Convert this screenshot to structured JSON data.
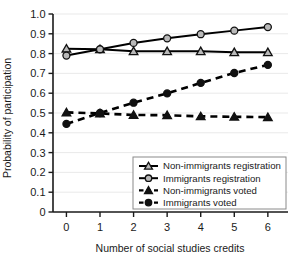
{
  "chart_data": {
    "type": "line",
    "title": "",
    "xlabel": "Number of social studies credits",
    "ylabel": "Probability of participation",
    "xlim": [
      -0.4,
      6.6
    ],
    "ylim": [
      0,
      1.0
    ],
    "xticks": [
      "0",
      "1",
      "2",
      "3",
      "4",
      "5",
      "6"
    ],
    "xtick_values": [
      0,
      1,
      2,
      3,
      4,
      5,
      6
    ],
    "yticks": [
      "0",
      "0.1",
      "0.2",
      "0.3",
      "0.4",
      "0.5",
      "0.6",
      "0.7",
      "0.8",
      "0.9",
      "1.0"
    ],
    "ytick_values": [
      0,
      0.1,
      0.2,
      0.3,
      0.4,
      0.5,
      0.6,
      0.7,
      0.8,
      0.9,
      1.0
    ],
    "grid": true,
    "legend_position": "lower-right",
    "x": [
      0,
      1,
      2,
      3,
      4,
      5,
      6
    ],
    "series": [
      {
        "name": "Non-immigrants registration",
        "marker": "open-triangle",
        "line": "solid",
        "color": "#000000",
        "values": [
          0.825,
          0.822,
          0.812,
          0.812,
          0.812,
          0.807,
          0.807
        ]
      },
      {
        "name": "Immigrants registration",
        "marker": "open-circle",
        "line": "solid",
        "color": "#000000",
        "values": [
          0.79,
          0.822,
          0.854,
          0.877,
          0.898,
          0.916,
          0.934
        ]
      },
      {
        "name": "Non-immigrants voted",
        "marker": "filled-triangle",
        "line": "dashed",
        "color": "#000000",
        "values": [
          0.503,
          0.498,
          0.49,
          0.489,
          0.483,
          0.481,
          0.479
        ]
      },
      {
        "name": "Immigrants voted",
        "marker": "filled-circle",
        "line": "dashed",
        "color": "#000000",
        "values": [
          0.445,
          0.5,
          0.552,
          0.599,
          0.652,
          0.702,
          0.743
        ]
      }
    ]
  },
  "legend": {
    "entries": [
      {
        "label": "Non-immigrants registration"
      },
      {
        "label": "Immigrants registration"
      },
      {
        "label": "Non-immigrants voted"
      },
      {
        "label": "Immigrants voted"
      }
    ]
  },
  "axis": {
    "x_title": "Number of social studies credits",
    "y_title": "Probability of participation"
  }
}
